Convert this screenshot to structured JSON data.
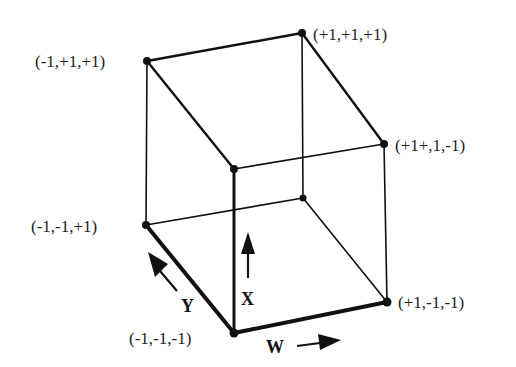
{
  "diagram": {
    "type": "3D cube with labeled vertices and axis arrows",
    "vertices": [
      {
        "id": "A",
        "label": "(-1,+1,+1)",
        "x": 147,
        "y": 61
      },
      {
        "id": "B",
        "label": "(+1,+1,+1)",
        "x": 302,
        "y": 33
      },
      {
        "id": "C",
        "label": "(+1+,1,-1)",
        "x": 384,
        "y": 144
      },
      {
        "id": "D",
        "label": "",
        "x": 234,
        "y": 169
      },
      {
        "id": "E",
        "label": "(-1,-1,+1)",
        "x": 146,
        "y": 225
      },
      {
        "id": "F",
        "label": "",
        "x": 303,
        "y": 198
      },
      {
        "id": "G",
        "label": "(-1,-1,-1)",
        "x": 234,
        "y": 333
      },
      {
        "id": "H",
        "label": "(+1,-1,-1)",
        "x": 387,
        "y": 302
      }
    ],
    "axes": [
      {
        "name": "W",
        "direction": "right"
      },
      {
        "name": "X",
        "direction": "up"
      },
      {
        "name": "Y",
        "direction": "up-left"
      }
    ]
  },
  "labels": {
    "v_mpp": "(-1,+1,+1)",
    "v_ppp": "(+1,+1,+1)",
    "v_ppm": "(+1+,1,-1)",
    "v_mmp": "(-1,-1,+1)",
    "v_mmm": "(-1,-1,-1)",
    "v_pmm": "(+1,-1,-1)",
    "axis_w": "W",
    "axis_x": "X",
    "axis_y": "Y"
  }
}
